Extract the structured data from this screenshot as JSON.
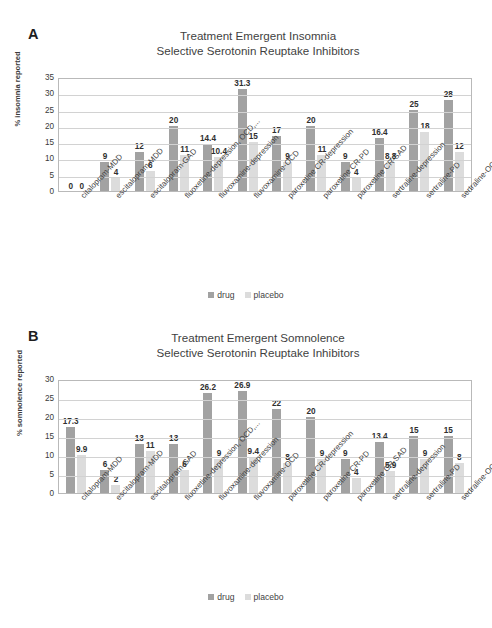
{
  "figure": {
    "legend": {
      "drug_label": "drug",
      "placebo_label": "placebo"
    },
    "colors": {
      "drug": "#a2a2a2",
      "placebo": "#dcdcdc",
      "grid": "#d2d2d2",
      "axis": "#b9b9b9",
      "text": "#3f3f3f"
    }
  },
  "panel_a": {
    "letter": "A",
    "title_line1": "Treatment Emergent Insomnia",
    "title_line2": "Selective Serotonin Reuptake Inhibitors",
    "legend": {
      "drug_label": "drug",
      "placebo_label": "placebo"
    }
  },
  "panel_b": {
    "letter": "B",
    "title_line1": "Treatment Emergent Somnolence",
    "title_line2": "Selective Serotonin Reuptake Inhibitors",
    "legend": {
      "drug_label": "drug",
      "placebo_label": "placebo"
    }
  },
  "chart_data": [
    {
      "panel": "A",
      "type": "bar",
      "title": "Treatment Emergent Insomnia\nSelective Serotonin Reuptake Inhibitors",
      "xlabel": "",
      "ylabel": "% insomnia reported",
      "ylim": [
        0,
        35
      ],
      "yticks": [
        0,
        5,
        10,
        15,
        20,
        25,
        30,
        35
      ],
      "grid": true,
      "legend_position": "bottom-center",
      "categories": [
        "citalopram-MDD",
        "escitalopram-MDD",
        "escitalopram-GAD",
        "fluoxetine-depression, OCD,...",
        "fluvoxamine-depression",
        "fluvoxamine-OCD",
        "paroxetine CR-depression",
        "paroxetine CR-PD",
        "paroxetine CR-SAD",
        "sertraline-depression",
        "sertraline-PD",
        "sertraline-OCD"
      ],
      "series": [
        {
          "name": "drug",
          "color": "#a2a2a2",
          "values": [
            0,
            9,
            12,
            20,
            14.4,
            31.3,
            17,
            20,
            9,
            16.4,
            25,
            28
          ],
          "labels": [
            "0",
            "9",
            "12",
            "20",
            "14.4",
            "31.3",
            "17",
            "20",
            "9",
            "16.4",
            "25",
            "28"
          ]
        },
        {
          "name": "placebo",
          "color": "#dcdcdc",
          "values": [
            0,
            4,
            6,
            11,
            10.4,
            15,
            9,
            11,
            4,
            8.8,
            18,
            12
          ],
          "labels": [
            "0",
            "4",
            "6",
            "11",
            "10.4",
            "15",
            "9",
            "11",
            "4",
            "8.8",
            "18",
            "12"
          ]
        }
      ]
    },
    {
      "panel": "B",
      "type": "bar",
      "title": "Treatment Emergent Somnolence\nSelective Serotonin Reuptake Inhibitors",
      "xlabel": "",
      "ylabel": "% somnolence reported",
      "ylim": [
        0,
        30
      ],
      "yticks": [
        0,
        5,
        10,
        15,
        20,
        25,
        30
      ],
      "grid": true,
      "legend_position": "bottom-center",
      "categories": [
        "citalopram-MDD",
        "escitalopram-MDD",
        "escitalopram-GAD",
        "fluoxetine-depression, OCD,...",
        "fluvoxamine-depression",
        "fluvoxamine-OCD",
        "paroxetine CR-depression",
        "paroxetine CR-PD",
        "paroxetine CR-SAD",
        "sertraline-depression",
        "sertraline-PD",
        "sertraline-OCD"
      ],
      "series": [
        {
          "name": "drug",
          "color": "#a2a2a2",
          "values": [
            17.3,
            6,
            13,
            13,
            26.2,
            26.9,
            22,
            20,
            9,
            13.4,
            15,
            15
          ],
          "labels": [
            "17.3",
            "6",
            "13",
            "13",
            "26.2",
            "26.9",
            "22",
            "20",
            "9",
            "13.4",
            "15",
            "15"
          ]
        },
        {
          "name": "placebo",
          "color": "#dcdcdc",
          "values": [
            9.9,
            2,
            11,
            6,
            9,
            9.4,
            8,
            9,
            4,
            5.9,
            9,
            8
          ],
          "labels": [
            "9.9",
            "2",
            "11",
            "6",
            "9",
            "9.4",
            "8",
            "9",
            "4",
            "5.9",
            "9",
            "8"
          ]
        }
      ]
    }
  ],
  "page_bleed": {
    "top": "",
    "bottom": ""
  }
}
